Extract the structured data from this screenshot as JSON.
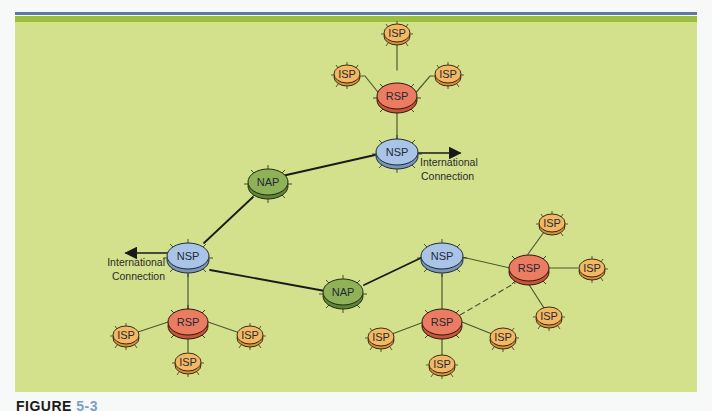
{
  "figure": {
    "caption_prefix": "FIGURE",
    "caption_number": "5-3"
  },
  "colors": {
    "panel_bg": "#d3e18d",
    "top_bar_blue": "#5b7aa0",
    "top_bar_green": "#9dbd3c",
    "nsp_fill": "#a9c4e6",
    "nap_fill": "#8fb158",
    "rsp_fill": "#ec7c61",
    "isp_fill": "#f3b863"
  },
  "labels": {
    "international_line1": "International",
    "international_line2": "Connection"
  },
  "nodes": {
    "rsp_top": "RSP",
    "isp_top_center": "ISP",
    "isp_top_left": "ISP",
    "isp_top_right": "ISP",
    "nsp_top": "NSP",
    "nap_upper": "NAP",
    "nsp_left": "NSP",
    "nap_lower": "NAP",
    "rsp_left": "RSP",
    "isp_left_a": "ISP",
    "isp_left_b": "ISP",
    "isp_left_c": "ISP",
    "nsp_right": "NSP",
    "rsp_right_lower": "RSP",
    "rsp_right_upper": "RSP",
    "isp_rl_a": "ISP",
    "isp_rl_b": "ISP",
    "isp_rl_c": "ISP",
    "isp_ru_a": "ISP",
    "isp_ru_b": "ISP",
    "isp_ru_c": "ISP"
  }
}
